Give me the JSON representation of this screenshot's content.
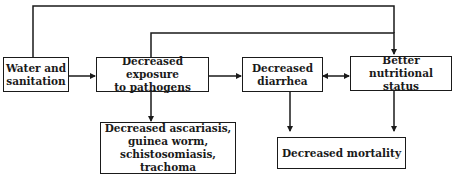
{
  "diagram": {
    "type": "flowchart",
    "nodes": {
      "water": {
        "label": "Water and\nsanitation"
      },
      "exposure": {
        "label": "Decreased exposure\nto pathogens"
      },
      "diarrhea": {
        "label": "Decreased\ndiarrhea"
      },
      "nutrition": {
        "label": "Better nutritional\nstatus"
      },
      "diseases": {
        "label": "Decreased ascariasis,\nguinea worm,\nschistosomiasis, trachoma"
      },
      "mortality": {
        "label": "Decreased mortality"
      }
    },
    "edges": [
      {
        "from": "Water and sanitation",
        "to": "Decreased exposure to pathogens",
        "type": "arrow"
      },
      {
        "from": "Water and sanitation",
        "to": "Better nutritional status",
        "type": "arrow",
        "route": "top"
      },
      {
        "from": "Decreased exposure to pathogens",
        "to": "Better nutritional status",
        "type": "arrow",
        "route": "top"
      },
      {
        "from": "Decreased exposure to pathogens",
        "to": "Decreased diarrhea",
        "type": "arrow"
      },
      {
        "from": "Decreased exposure to pathogens",
        "to": "Decreased ascariasis, guinea worm, schistosomiasis, trachoma",
        "type": "arrow"
      },
      {
        "from": "Decreased diarrhea",
        "to": "Better nutritional status",
        "type": "bidirectional"
      },
      {
        "from": "Decreased diarrhea",
        "to": "Decreased mortality",
        "type": "arrow"
      },
      {
        "from": "Better nutritional status",
        "to": "Decreased mortality",
        "type": "arrow"
      }
    ],
    "colors": {
      "line": "#1a1a1a",
      "background": "#ffffff"
    }
  }
}
